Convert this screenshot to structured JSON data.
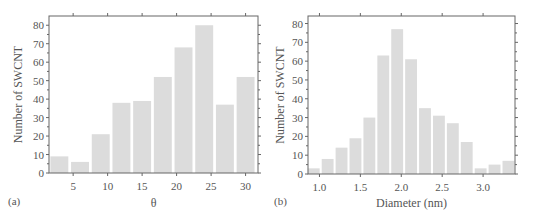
{
  "colors": {
    "bar": "#dcdcdc",
    "axis": "#666666",
    "text": "#555555"
  },
  "chart_data": [
    {
      "panel_label": "(a)",
      "type": "bar",
      "title": "",
      "xlabel": "θ",
      "ylabel": "Number of SWCNT",
      "x": [
        3,
        6,
        9,
        12,
        15,
        18,
        21,
        24,
        27,
        30
      ],
      "values": [
        9,
        6,
        21,
        38,
        39,
        52,
        68,
        80,
        37,
        52
      ],
      "bar_width": 2.6,
      "xlim": [
        1.5,
        31.8
      ],
      "ylim": [
        0,
        85
      ],
      "xticks": [
        5,
        10,
        15,
        20,
        25,
        30
      ],
      "xtick_labels": [
        "5",
        "10",
        "15",
        "20",
        "25",
        "30"
      ],
      "yticks": [
        0,
        10,
        20,
        30,
        40,
        50,
        60,
        70,
        80
      ],
      "ytick_labels": [
        "0",
        "10",
        "20",
        "30",
        "40",
        "50",
        "60",
        "70",
        "80"
      ],
      "grid": false,
      "legend": null
    },
    {
      "panel_label": "(b)",
      "type": "bar",
      "title": "",
      "xlabel": "Diameter (nm)",
      "ylabel": "Number of SWCNT",
      "x": [
        0.93,
        1.1,
        1.27,
        1.44,
        1.61,
        1.78,
        1.95,
        2.12,
        2.29,
        2.46,
        2.63,
        2.8,
        2.97,
        3.14,
        3.31
      ],
      "values": [
        3,
        8,
        14,
        19,
        30,
        63,
        77,
        61,
        35,
        31,
        27,
        17,
        3,
        5,
        7
      ],
      "bar_width": 0.145,
      "xlim": [
        0.86,
        3.39
      ],
      "ylim": [
        0,
        84
      ],
      "xticks": [
        1.0,
        1.5,
        2.0,
        2.5,
        3.0
      ],
      "xtick_labels": [
        "1.0",
        "1.5",
        "2.0",
        "2.5",
        "3.0"
      ],
      "yticks": [
        0,
        10,
        20,
        30,
        40,
        50,
        60,
        70,
        80
      ],
      "ytick_labels": [
        "0",
        "10",
        "20",
        "30",
        "40",
        "50",
        "60",
        "70",
        "80"
      ],
      "grid": false,
      "legend": null
    }
  ]
}
